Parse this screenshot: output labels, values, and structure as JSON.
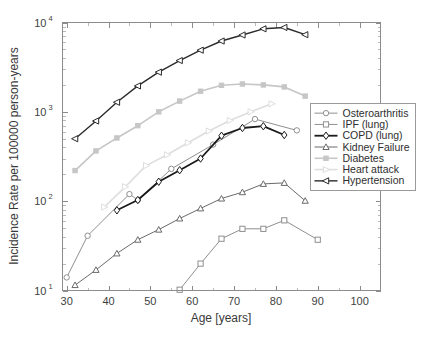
{
  "chart_data": {
    "type": "line",
    "title": "",
    "xlabel": "Age [years]",
    "ylabel": "Incidence Rate per 100000 person-years",
    "xlim": [
      29,
      105
    ],
    "ylim": [
      10,
      10000
    ],
    "yscale": "log",
    "xscale": "linear",
    "grid": false,
    "legend_position": "right-middle",
    "xticks": [
      30,
      40,
      50,
      60,
      70,
      80,
      90,
      100
    ],
    "xtick_labels": [
      "30",
      "40",
      "50",
      "60",
      "70",
      "80",
      "90",
      "100"
    ],
    "yticks": [
      10,
      100,
      1000,
      10000
    ],
    "ytick_labels": [
      "10^1",
      "10^2",
      "10^3",
      "10^4"
    ],
    "ytick_base": "10",
    "ytick_exponents": [
      "1",
      "2",
      "3",
      "4"
    ],
    "series": [
      {
        "name": "Osteroarthritis",
        "color": "#8f8f8f",
        "marker": "circle",
        "linewidth": 1,
        "x": [
          30,
          35,
          45,
          47,
          55,
          65,
          75,
          85
        ],
        "values": [
          14,
          41,
          120,
          103,
          230,
          430,
          830,
          620
        ]
      },
      {
        "name": "IPF (lung)",
        "color": "#8f8f8f",
        "marker": "square",
        "linewidth": 1,
        "x": [
          57,
          62,
          67,
          72,
          77,
          82,
          90
        ],
        "values": [
          10.2,
          20,
          38,
          49,
          49,
          61,
          37
        ]
      },
      {
        "name": "COPD (lung)",
        "color": "#1a1a1a",
        "marker": "diamond",
        "linewidth": 1.8,
        "x": [
          42,
          47,
          52,
          57,
          62,
          67,
          72,
          77,
          82
        ],
        "values": [
          79,
          103,
          165,
          222,
          300,
          540,
          660,
          690,
          550
        ]
      },
      {
        "name": "Kidney Failure",
        "color": "#6a6a6a",
        "marker": "triangle-up",
        "linewidth": 1,
        "x": [
          32,
          37,
          42,
          47,
          52,
          57,
          62,
          67,
          72,
          77,
          82,
          87
        ],
        "values": [
          11.5,
          17,
          26,
          37,
          48,
          64,
          83,
          107,
          126,
          156,
          160,
          101
        ]
      },
      {
        "name": "Diabetes",
        "color": "#c6c6c6",
        "marker": "square-filled",
        "linewidth": 1.6,
        "x": [
          32,
          37,
          42,
          47,
          52,
          57,
          62,
          67,
          72,
          77,
          82,
          87
        ],
        "values": [
          220,
          365,
          510,
          700,
          1000,
          1320,
          1700,
          1980,
          2050,
          2000,
          1900,
          1500
        ]
      },
      {
        "name": "Heart attack",
        "color": "#dedede",
        "marker": "triangle-right",
        "linewidth": 1.6,
        "x": [
          39,
          44,
          49,
          54,
          59,
          64,
          69,
          74,
          79
        ],
        "values": [
          86,
          145,
          250,
          330,
          450,
          610,
          800,
          1000,
          1230
        ]
      },
      {
        "name": "Hypertension",
        "color": "#2b2b2b",
        "marker": "triangle-left",
        "linewidth": 1.4,
        "x": [
          32,
          37,
          42,
          47,
          52,
          57,
          62,
          67,
          72,
          77,
          82,
          87
        ],
        "values": [
          500,
          790,
          1280,
          1950,
          2780,
          3750,
          4900,
          6200,
          7250,
          8500,
          8800,
          7300
        ]
      }
    ]
  },
  "legend": {
    "items": [
      {
        "label": "Osteroarthritis"
      },
      {
        "label": "IPF (lung)"
      },
      {
        "label": "COPD (lung)"
      },
      {
        "label": "Kidney Failure"
      },
      {
        "label": "Diabetes"
      },
      {
        "label": "Heart attack"
      },
      {
        "label": "Hypertension"
      }
    ]
  }
}
